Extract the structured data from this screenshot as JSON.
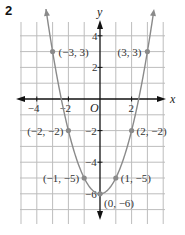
{
  "figure_number": "2",
  "chart_data": {
    "type": "line",
    "title": "",
    "xlabel": "x",
    "ylabel": "y",
    "origin_label": "O",
    "xlim": [
      -5,
      4
    ],
    "ylim": [
      -7,
      4
    ],
    "grid": true,
    "x_ticks": [
      {
        "value": -4,
        "label": "−4"
      },
      {
        "value": -2,
        "label": "−2"
      },
      {
        "value": 2,
        "label": "2"
      }
    ],
    "y_ticks": [
      {
        "value": 4,
        "label": "4"
      },
      {
        "value": 2,
        "label": "2"
      },
      {
        "value": -2,
        "label": "−2"
      },
      {
        "value": -4,
        "label": "−4"
      },
      {
        "value": -6,
        "label": "−6"
      }
    ],
    "equation": "y = x^2 - 6",
    "series": [
      {
        "name": "parabola",
        "color": "#8a8a8a",
        "points": [
          {
            "x": -3,
            "y": 3,
            "label": "(−3, 3)"
          },
          {
            "x": -2,
            "y": -2,
            "label": "(−2, −2)"
          },
          {
            "x": -1,
            "y": -5,
            "label": "(−1, −5)"
          },
          {
            "x": 0,
            "y": -6,
            "label": "(0, −6)"
          },
          {
            "x": 1,
            "y": -5,
            "label": "(1, −5)"
          },
          {
            "x": 2,
            "y": -2,
            "label": "(2, −2)"
          },
          {
            "x": 3,
            "y": 3,
            "label": "(3, 3)"
          }
        ]
      }
    ]
  }
}
